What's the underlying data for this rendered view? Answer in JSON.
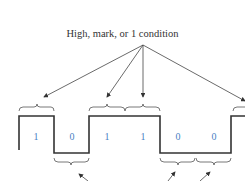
{
  "diagram": {
    "title": "High, mark, or 1 condition",
    "bits": [
      "1",
      "0",
      "1",
      "1",
      "0",
      "0"
    ],
    "colors": {
      "line": "#333333",
      "bit_label": "#4a7fc4",
      "background": "#ffffff"
    },
    "annotation_target": "high-level bit periods (1 condition)",
    "bottom_arrows_note": "arrows pointing to low-level (0) bit periods; label cropped"
  }
}
